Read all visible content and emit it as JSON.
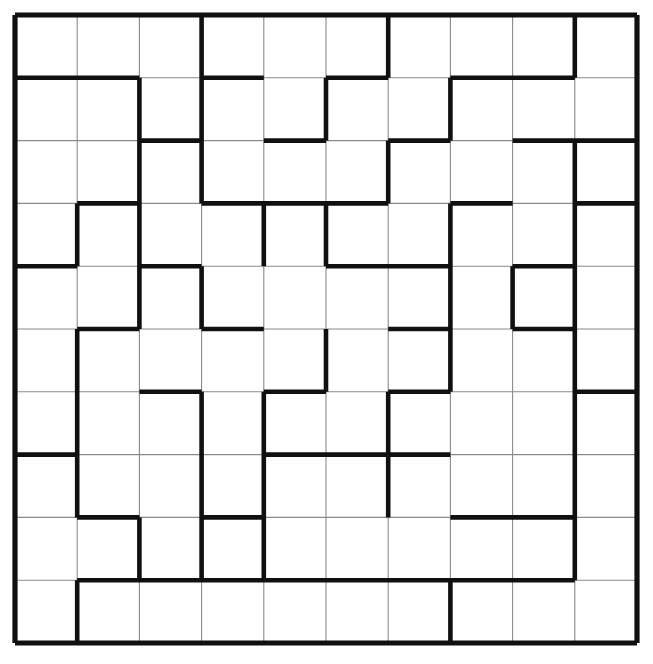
{
  "puzzle": {
    "type": "grid-region-partition-puzzle",
    "title": "",
    "rows": 10,
    "cols": 10,
    "geometry": {
      "left": 15,
      "top": 15,
      "cell_width": 62.2,
      "cell_height": 62.8,
      "thin_width": 1.1,
      "thick_width": 4.6,
      "outer_width": 5.2
    },
    "colors": {
      "background": "#ffffff",
      "thin_line": "#8a8a8a",
      "thick_line": "#101010",
      "outer_border": "#101010"
    },
    "thick_horizontal_segments": [
      {
        "row": 0,
        "cols": [
          1,
          2,
          3,
          4,
          5,
          6,
          7,
          8,
          9,
          10
        ]
      },
      {
        "row": 1,
        "cols": [
          1,
          2,
          4,
          6,
          8,
          9
        ]
      },
      {
        "row": 2,
        "cols": [
          3,
          5,
          7,
          9,
          10
        ]
      },
      {
        "row": 3,
        "cols": [
          2,
          4,
          5,
          6,
          8,
          10
        ]
      },
      {
        "row": 4,
        "cols": [
          1,
          3,
          6,
          7,
          9
        ]
      },
      {
        "row": 5,
        "cols": [
          2,
          4,
          7,
          9
        ]
      },
      {
        "row": 6,
        "cols": [
          3,
          5,
          7,
          10
        ]
      },
      {
        "row": 7,
        "cols": [
          1,
          5,
          6,
          7
        ]
      },
      {
        "row": 8,
        "cols": [
          2,
          4,
          8,
          9
        ]
      },
      {
        "row": 9,
        "cols": [
          2,
          3,
          4,
          5,
          6,
          7,
          8,
          9
        ]
      },
      {
        "row": 10,
        "cols": [
          1,
          2,
          3,
          4,
          5,
          6,
          7,
          8,
          9,
          10
        ]
      }
    ],
    "thick_vertical_segments": [
      {
        "col": 0,
        "rows": [
          1,
          2,
          3,
          4,
          5,
          6,
          7,
          8,
          9,
          10
        ]
      },
      {
        "col": 1,
        "rows": [
          4,
          6,
          7,
          8,
          10
        ]
      },
      {
        "col": 2,
        "rows": [
          2,
          3,
          4,
          5,
          9
        ]
      },
      {
        "col": 3,
        "rows": [
          1,
          2,
          3,
          5,
          7,
          8,
          9
        ]
      },
      {
        "col": 4,
        "rows": [
          4,
          7,
          8,
          9
        ]
      },
      {
        "col": 5,
        "rows": [
          2,
          4,
          6
        ]
      },
      {
        "col": 6,
        "rows": [
          1,
          3,
          7,
          8
        ]
      },
      {
        "col": 7,
        "rows": [
          2,
          4,
          5,
          6,
          10
        ]
      },
      {
        "col": 8,
        "rows": [
          5
        ]
      },
      {
        "col": 9,
        "rows": [
          1,
          3,
          4,
          5,
          6,
          7,
          8,
          9
        ]
      },
      {
        "col": 10,
        "rows": [
          1,
          2,
          3,
          4,
          5,
          6,
          7,
          8,
          9,
          10
        ]
      }
    ]
  }
}
